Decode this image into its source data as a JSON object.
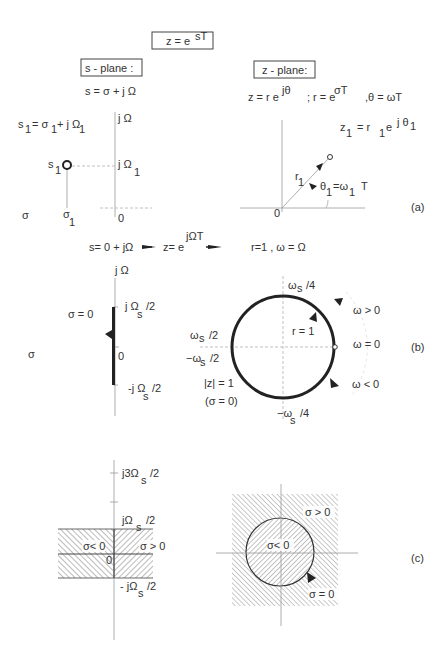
{
  "header": {
    "mapping_formula": "z = e^(sT)",
    "mapping_base": "z  = e",
    "mapping_exp": "sT"
  },
  "s_plane": {
    "title": "s  -  plane :",
    "definition": "s =  σ + j Ω",
    "point_def": {
      "base": "s",
      "sub": "1",
      "rest": "= σ",
      "sub2": "1",
      "rest2": "+ j Ω",
      "sub3": "1"
    },
    "axis_imag": "j Ω",
    "axis_real": "σ",
    "origin": "0",
    "point_label": "s",
    "point_label_sub": "1",
    "imag_tick": "j Ω",
    "imag_tick_sub": "1",
    "real_tick": "σ",
    "real_tick_sub": "1"
  },
  "z_plane": {
    "title": "z -  plane:",
    "definition_z": "z = r e",
    "definition_z_exp": "jθ",
    "definition_r": "; r = e",
    "definition_r_exp": "σT",
    "definition_theta": ",θ = ωT",
    "point_def": "z",
    "point_def_sub": "1",
    "point_def_rest": "=  r",
    "point_def_rsub": "1",
    "point_def_e": "e",
    "point_def_exp": "j θ",
    "point_def_exp_sub": "1",
    "radius_label": "r",
    "radius_sub": "1",
    "angle_label": "θ",
    "angle_sub": "1",
    "angle_rest": "=ω",
    "angle_rest_sub": "1",
    "angle_T": "T",
    "origin": "0"
  },
  "panels": {
    "a": "(a)",
    "b": "(b)",
    "c": "(c)"
  },
  "mapping_b": {
    "s_def": "s= 0 + jΩ",
    "z_def": "z= e",
    "z_exp": "jΩT",
    "result": "r=1 , ω = Ω"
  },
  "panel_b_s": {
    "axis_imag": "j Ω",
    "axis_real": "σ",
    "sigma_zero": "σ = 0",
    "origin": "0",
    "top_tick": "j Ω",
    "top_tick_sub": "s",
    "top_tick_rest": "/2",
    "bottom_tick": "-j Ω",
    "bottom_tick_sub": "s",
    "bottom_tick_rest": "/2"
  },
  "panel_b_z": {
    "top": "ω",
    "top_sub": "s",
    "top_rest": "/4",
    "left_top": "ω",
    "left_top_sub": "s",
    "left_top_rest": "/2",
    "left_bottom": "−ω",
    "left_bottom_sub": "s",
    "left_bottom_rest": "/2",
    "bottom": "−ω",
    "bottom_sub": "s",
    "bottom_rest": "/4",
    "radius": "r = 1",
    "omega_zero": "ω = 0",
    "omega_pos": "ω > 0",
    "omega_neg": "ω < 0",
    "unit_circle": "|z| = 1",
    "sigma_note": "(σ = 0)"
  },
  "panel_c_s": {
    "tick_3": "j3Ω",
    "tick_3_sub": "s",
    "tick_3_rest": "/2",
    "tick_1": "jΩ",
    "tick_1_sub": "s",
    "tick_1_rest": "/2",
    "tick_neg": "- jΩ",
    "tick_neg_sub": "s",
    "tick_neg_rest": "/2",
    "left_region": "σ< 0",
    "right_region": "σ > 0",
    "origin": "0"
  },
  "panel_c_z": {
    "inside": "σ< 0",
    "outside": "σ > 0",
    "boundary": "σ = 0"
  }
}
